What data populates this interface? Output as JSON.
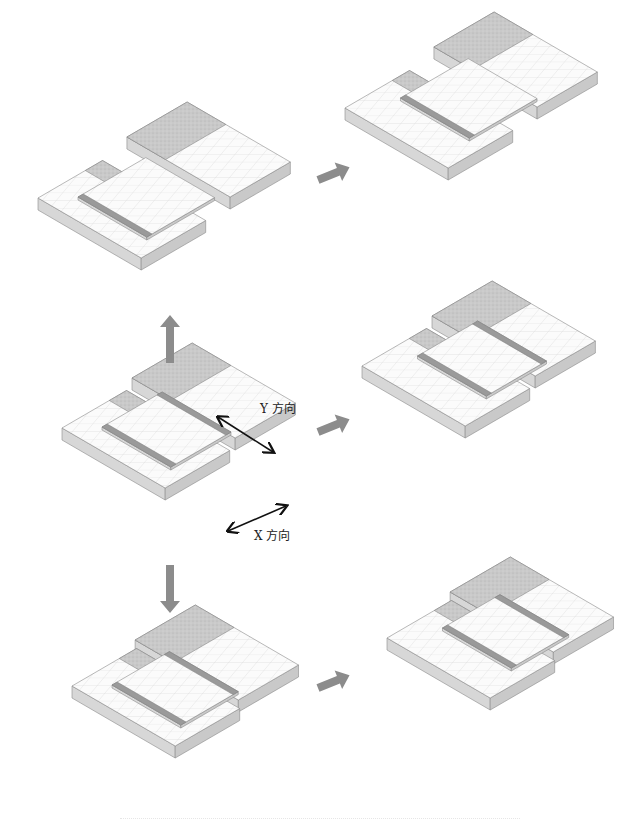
{
  "diagram": {
    "labels": {
      "y_direction": "Y 方向",
      "x_direction": "X 方向"
    },
    "colors": {
      "top_surface": "#fbfbfb",
      "grid_line": "#d9d9d9",
      "side_face": "#d7d7d7",
      "front_face": "#c9c9c9",
      "textured_band": "#c6c6c6",
      "seam_strip": "#9a9a9a",
      "flow_arrow": "#8c8c8c",
      "dimension_arrow": "#111111"
    },
    "panels": [
      {
        "id": "center",
        "state": "initial",
        "description": "Two stepped slabs with overlap plate, direction arrows shown"
      },
      {
        "id": "top-left",
        "state": "shifted +Y (wide gap)"
      },
      {
        "id": "top-right",
        "state": "shifted +Y then +X"
      },
      {
        "id": "middle-right",
        "state": "shifted +X"
      },
      {
        "id": "bottom-left",
        "state": "shifted -Y (closed)"
      },
      {
        "id": "bottom-right",
        "state": "shifted -Y then +X"
      }
    ],
    "flow": [
      {
        "from": "center",
        "to": "top-left",
        "direction": "up"
      },
      {
        "from": "center",
        "to": "bottom-left",
        "direction": "down"
      },
      {
        "from": "center",
        "to": "middle-right",
        "direction": "right"
      },
      {
        "from": "top-left",
        "to": "top-right",
        "direction": "right"
      },
      {
        "from": "bottom-left",
        "to": "bottom-right",
        "direction": "right"
      }
    ]
  }
}
